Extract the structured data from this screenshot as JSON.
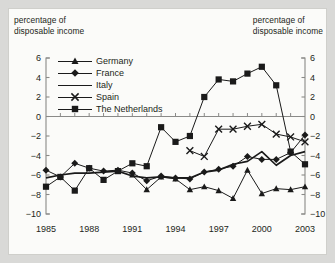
{
  "labels": {
    "left_axis_note": "percentage of\ndisposable income",
    "right_axis_note": "percentage of\ndisposable income"
  },
  "legend": [
    {
      "label": "Germany",
      "marker": "triangle"
    },
    {
      "label": "France",
      "marker": "diamond"
    },
    {
      "label": "Italy",
      "marker": "none"
    },
    {
      "label": "Spain",
      "marker": "cross"
    },
    {
      "label": "The Netherlands",
      "marker": "square"
    }
  ],
  "colors": {
    "ink": "#1a1a1a",
    "axis": "#8a8a88",
    "plate": "#fbfbf9",
    "mount": "#d9d9d7"
  },
  "chart_data": {
    "type": "line",
    "title": "",
    "subtitle": "",
    "xlabel": "",
    "ylabel": "percentage of disposable income",
    "y2label": "percentage of disposable income",
    "grid": false,
    "legend_position": "inside-top-left",
    "xlim": [
      1985,
      2003
    ],
    "ylim": [
      -10,
      6
    ],
    "yticks": [
      6,
      4,
      2,
      0,
      -2,
      -4,
      -6,
      -8,
      -10
    ],
    "ytick_labels": [
      "6",
      "4",
      "2",
      "0",
      "−2",
      "−4",
      "−6",
      "−8",
      "−10"
    ],
    "xticks": [
      1985,
      1988,
      1991,
      1994,
      1997,
      2000,
      2003
    ],
    "xtick_labels": [
      "1985",
      "1988",
      "1991",
      "1994",
      "1997",
      "2000",
      "2003"
    ],
    "x": [
      1985,
      1986,
      1987,
      1988,
      1989,
      1990,
      1991,
      1992,
      1993,
      1994,
      1995,
      1996,
      1997,
      1998,
      1999,
      2000,
      2001,
      2002,
      2003
    ],
    "series": [
      {
        "name": "Germany",
        "marker": "triangle",
        "x": [
          1991,
          1992,
          1993,
          1994,
          1995,
          1996,
          1997,
          1998,
          1999,
          2000,
          2001,
          2002,
          2003
        ],
        "values": [
          -6.0,
          -7.5,
          -6.2,
          -6.4,
          -7.5,
          -7.2,
          -7.6,
          -8.4,
          -5.5,
          -7.9,
          -7.4,
          -7.5,
          -7.2
        ]
      },
      {
        "name": "France",
        "marker": "diamond",
        "x": [
          1985,
          1986,
          1987,
          1988,
          1989,
          1990,
          1991,
          1992,
          1993,
          1994,
          1995,
          1996,
          1997,
          1998,
          1999,
          2000,
          2001,
          2002,
          2003
        ],
        "values": [
          -5.5,
          -6.2,
          -4.8,
          -5.3,
          -5.6,
          -5.5,
          -5.8,
          -6.6,
          -6.1,
          -6.3,
          -6.4,
          -5.7,
          -5.4,
          -5.1,
          -4.1,
          -4.4,
          -4.4,
          -3.7,
          -1.9
        ]
      },
      {
        "name": "Italy",
        "marker": "none",
        "x": [
          1985,
          1986,
          1987,
          1988,
          1989,
          1990,
          1991,
          1992,
          1993,
          1994,
          1995,
          1996,
          1997,
          1998,
          1999,
          2000,
          2001,
          2002,
          2003
        ],
        "values": [
          -6.3,
          -6.0,
          -5.8,
          -5.8,
          -5.7,
          -5.6,
          -6.1,
          -6.3,
          -6.2,
          -6.3,
          -6.3,
          -5.7,
          -5.5,
          -4.9,
          -4.6,
          -3.6,
          -5.0,
          -4.0,
          -3.6
        ]
      },
      {
        "name": "Spain",
        "marker": "cross",
        "x": [
          1995,
          1996,
          1997,
          1998,
          1999,
          2000,
          2001,
          2002,
          2003
        ],
        "values": [
          -3.5,
          -4.1,
          -1.3,
          -1.3,
          -1.0,
          -0.8,
          -1.8,
          -2.1,
          -2.6
        ]
      },
      {
        "name": "The Netherlands",
        "marker": "square",
        "x": [
          1985,
          1986,
          1987,
          1988,
          1989,
          1990,
          1991,
          1992,
          1993,
          1994,
          1995,
          1996,
          1997,
          1998,
          1999,
          2000,
          2001,
          2002,
          2003
        ],
        "values": [
          -7.2,
          -6.2,
          -7.6,
          -5.3,
          -6.5,
          -5.6,
          -4.8,
          -5.1,
          -1.1,
          -2.6,
          -2.0,
          2.0,
          3.8,
          3.6,
          4.4,
          5.1,
          3.2,
          -3.6,
          -4.9
        ]
      }
    ]
  }
}
